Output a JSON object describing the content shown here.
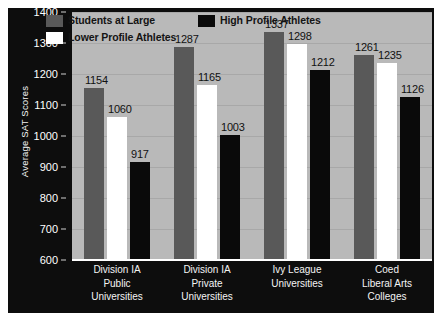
{
  "chart_data": {
    "type": "bar",
    "title": "",
    "xlabel": "",
    "ylabel": "Average SAT Scores",
    "ylim": [
      600,
      1400
    ],
    "yticks": [
      600,
      700,
      800,
      900,
      1000,
      1100,
      1200,
      1300,
      1400
    ],
    "grid": true,
    "legend_position": "top-left-inside",
    "categories": [
      "Division IA Public Universities",
      "Division IA Private Universities",
      "Ivy League Universities",
      "Coed Liberal Arts Colleges"
    ],
    "category_lines": [
      [
        "Division IA",
        "Public",
        "Universities"
      ],
      [
        "Division IA",
        "Private",
        "Universities"
      ],
      [
        "Ivy League",
        "Universities"
      ],
      [
        "Coed",
        "Liberal Arts",
        "Colleges"
      ]
    ],
    "series": [
      {
        "name": "Students at Large",
        "color": "#595959",
        "values": [
          1154,
          1287,
          1337,
          1261
        ]
      },
      {
        "name": "Lower Profile Athletes",
        "color": "#ffffff",
        "values": [
          1060,
          1165,
          1298,
          1235
        ]
      },
      {
        "name": "High Profile Athletes",
        "color": "#0a0a0a",
        "values": [
          917,
          1003,
          1212,
          1126
        ]
      }
    ],
    "legend_entries": [
      {
        "label": "Students at Large",
        "color": "#595959"
      },
      {
        "label": "High Profile Athletes",
        "color": "#0a0a0a"
      },
      {
        "label": "Lower Profile Athletes",
        "color": "#ffffff"
      }
    ],
    "colors": {
      "figure_background": "#0d0d0d",
      "plot_background": "#b9b9b9",
      "gridline": "#a8a8a8",
      "axis_text": "#ffffff",
      "value_text": "#111111",
      "baseline": "#ffffff"
    }
  }
}
